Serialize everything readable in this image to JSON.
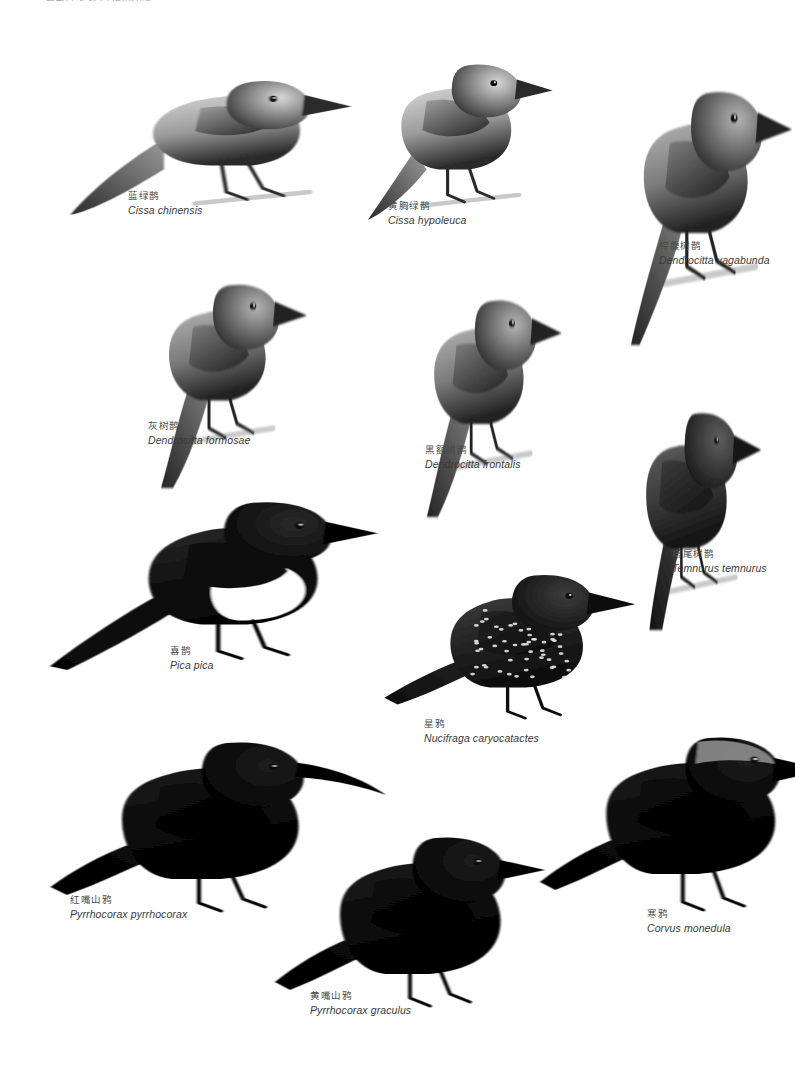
{
  "plate": {
    "running_head": "雀形目 鸦科 CORVIDAE",
    "background_color": "#ffffff",
    "ink_color": "#1a1a1a",
    "caption_cn_color": "#4a4a4a",
    "caption_sci_color": "#3a3a3a"
  },
  "species": [
    {
      "id": "cissa-chinensis",
      "cn": "蓝绿鹊",
      "sci": "Cissa chinensis",
      "icon": "bird-illustration-icon",
      "tone": "pale",
      "pose": "perched-long-tail-left",
      "x": 60,
      "y": 40,
      "w": 260,
      "h": 190,
      "caption_x": 128,
      "caption_y": 190
    },
    {
      "id": "cissa-hypoleuca",
      "cn": "黄胸绿鹊",
      "sci": "Cissa hypoleuca",
      "icon": "bird-illustration-icon",
      "tone": "pale",
      "pose": "perched-upright-mid-tail",
      "x": 330,
      "y": 40,
      "w": 210,
      "h": 180,
      "caption_x": 388,
      "caption_y": 200
    },
    {
      "id": "dendrocitta-vagabunda",
      "cn": "棕腹树鹊",
      "sci": "Dendrocitta vagabunda",
      "icon": "bird-illustration-icon",
      "tone": "mid",
      "pose": "perched-very-long-tail-down",
      "x": 575,
      "y": 65,
      "w": 215,
      "h": 280,
      "caption_x": 659,
      "caption_y": 240
    },
    {
      "id": "dendrocitta-formosae",
      "cn": "灰树鹊",
      "sci": "Dendrocitta formosae",
      "icon": "bird-illustration-icon",
      "tone": "mid",
      "pose": "perched-long-tail-down",
      "x": 105,
      "y": 258,
      "w": 200,
      "h": 230,
      "caption_x": 148,
      "caption_y": 420
    },
    {
      "id": "dendrocitta-frontalis",
      "cn": "黑额树鹊",
      "sci": "Dendrocitta frontalis",
      "icon": "bird-illustration-icon",
      "tone": "mid",
      "pose": "perched-long-tail-down",
      "x": 375,
      "y": 272,
      "w": 185,
      "h": 245,
      "caption_x": 425,
      "caption_y": 444
    },
    {
      "id": "temnurus-temnurus",
      "cn": "塔尾树鹊",
      "sci": "Temnurus temnurus",
      "icon": "bird-illustration-icon",
      "tone": "dark",
      "pose": "perched-spine-tail",
      "x": 595,
      "y": 390,
      "w": 160,
      "h": 240,
      "caption_x": 672,
      "caption_y": 548
    },
    {
      "id": "pica-pica",
      "cn": "喜鹊",
      "sci": "Pica pica",
      "icon": "bird-illustration-icon",
      "tone": "pied",
      "pose": "standing-long-tail-left",
      "x": 50,
      "y": 480,
      "w": 290,
      "h": 190,
      "caption_x": 170,
      "caption_y": 645
    },
    {
      "id": "nucifraga-caryocatactes",
      "cn": "星鸦",
      "sci": "Nucifraga caryocatactes",
      "icon": "bird-illustration-icon",
      "tone": "speckled",
      "pose": "standing-short-tail",
      "x": 380,
      "y": 555,
      "w": 220,
      "h": 170,
      "caption_x": 424,
      "caption_y": 718
    },
    {
      "id": "pyrrhocorax-pyrrhocorax",
      "cn": "红嘴山鸦",
      "sci": "Pyrrhocorax pyrrhocorax",
      "icon": "bird-illustration-icon",
      "tone": "black",
      "pose": "standing-long-decurved-bill",
      "x": 45,
      "y": 715,
      "w": 275,
      "h": 200,
      "caption_x": 70,
      "caption_y": 894
    },
    {
      "id": "pyrrhocorax-graculus",
      "cn": "黄嘴山鸦",
      "sci": "Pyrrhocorax graculus",
      "icon": "bird-illustration-icon",
      "tone": "black",
      "pose": "standing-short-bill",
      "x": 270,
      "y": 810,
      "w": 250,
      "h": 200,
      "caption_x": 310,
      "caption_y": 990
    },
    {
      "id": "corvus-monedula",
      "cn": "寒鸦",
      "sci": "Corvus monedula",
      "icon": "bird-illustration-icon",
      "tone": "black",
      "pose": "standing-pale-nape",
      "x": 540,
      "y": 710,
      "w": 255,
      "h": 200,
      "caption_x": 647,
      "caption_y": 908
    }
  ]
}
